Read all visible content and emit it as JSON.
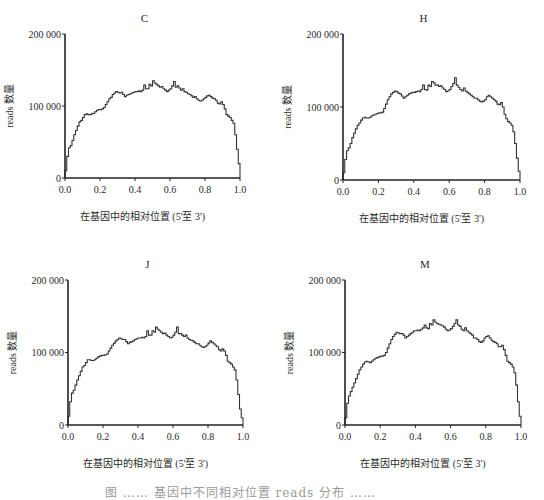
{
  "figure": {
    "caption": "图 …… 基因中不同相对位置 reads 分布 ……"
  },
  "chart_data": [
    {
      "type": "line",
      "style": "step",
      "title": "C",
      "xlabel": "在基因中的相对位置 (5'至 3')",
      "ylabel": "reads 数量",
      "xlim": [
        0,
        1
      ],
      "ylim": [
        0,
        200000
      ],
      "xticks": [
        "0.0",
        "0.2",
        "0.4",
        "0.6",
        "0.8",
        "1.0"
      ],
      "yticks": [
        "0",
        "100 000",
        "200 000"
      ],
      "grid": false,
      "legend": null,
      "x_step": 0.01,
      "values_k": [
        10,
        30,
        42,
        45,
        52,
        60,
        66,
        72,
        78,
        80,
        84,
        88,
        89,
        88,
        88,
        89,
        90,
        92,
        94,
        95,
        95,
        96,
        98,
        102,
        106,
        110,
        112,
        116,
        118,
        120,
        119,
        118,
        119,
        116,
        113,
        115,
        116,
        117,
        118,
        119,
        120,
        120,
        121,
        120,
        122,
        129,
        124,
        124,
        130,
        128,
        135,
        132,
        130,
        128,
        126,
        127,
        124,
        122,
        120,
        122,
        124,
        128,
        134,
        126,
        128,
        125,
        122,
        124,
        120,
        119,
        117,
        116,
        114,
        112,
        113,
        110,
        108,
        107,
        108,
        110,
        112,
        114,
        115,
        113,
        111,
        110,
        108,
        104,
        103,
        106,
        102,
        96,
        88,
        86,
        84,
        80,
        76,
        60,
        40,
        20
      ],
      "bbox": {
        "x0": 65,
        "y0": 34,
        "x1": 240,
        "y1": 178
      }
    },
    {
      "type": "line",
      "style": "step",
      "title": "H",
      "xlabel": "在基因中的相对位置 (5'至 3')",
      "ylabel": "reads 数量",
      "xlim": [
        0,
        1
      ],
      "ylim": [
        0,
        200000
      ],
      "xticks": [
        "0.0",
        "0.2",
        "0.4",
        "0.6",
        "0.8",
        "1.0"
      ],
      "yticks": [
        "0",
        "100 000",
        "200 000"
      ],
      "grid": false,
      "legend": null,
      "x_step": 0.01,
      "values_k": [
        10,
        28,
        40,
        44,
        50,
        58,
        64,
        70,
        75,
        78,
        82,
        85,
        86,
        85,
        85,
        86,
        88,
        89,
        90,
        91,
        92,
        92,
        93,
        98,
        104,
        110,
        114,
        118,
        120,
        122,
        121,
        119,
        118,
        115,
        112,
        114,
        116,
        118,
        119,
        120,
        120,
        121,
        122,
        121,
        124,
        130,
        124,
        123,
        130,
        128,
        135,
        133,
        130,
        130,
        128,
        129,
        126,
        124,
        121,
        122,
        124,
        128,
        132,
        140,
        130,
        127,
        124,
        122,
        126,
        122,
        120,
        118,
        116,
        114,
        112,
        112,
        110,
        108,
        107,
        108,
        110,
        114,
        116,
        114,
        112,
        110,
        108,
        104,
        103,
        106,
        100,
        90,
        84,
        80,
        78,
        75,
        66,
        50,
        30,
        12
      ],
      "bbox": {
        "x0": 343,
        "y0": 34,
        "x1": 520,
        "y1": 180
      }
    },
    {
      "type": "line",
      "style": "step",
      "title": "J",
      "xlabel": "在基因中的相对位置 (5'至 3')",
      "ylabel": "reads 数量",
      "xlim": [
        0,
        1
      ],
      "ylim": [
        0,
        200000
      ],
      "xticks": [
        "0.0",
        "0.2",
        "0.4",
        "0.6",
        "0.8",
        "1.0"
      ],
      "yticks": [
        "0",
        "100 000",
        "200 000"
      ],
      "grid": false,
      "legend": null,
      "x_step": 0.01,
      "values_k": [
        12,
        32,
        44,
        48,
        55,
        62,
        68,
        74,
        80,
        82,
        86,
        90,
        90,
        89,
        89,
        90,
        92,
        94,
        95,
        96,
        96,
        97,
        98,
        102,
        106,
        110,
        113,
        116,
        118,
        120,
        119,
        118,
        118,
        115,
        112,
        114,
        115,
        116,
        118,
        119,
        120,
        120,
        121,
        120,
        122,
        130,
        124,
        124,
        130,
        128,
        135,
        132,
        130,
        128,
        126,
        127,
        124,
        122,
        120,
        121,
        124,
        128,
        135,
        126,
        126,
        124,
        122,
        124,
        120,
        118,
        117,
        116,
        114,
        112,
        112,
        110,
        108,
        107,
        108,
        110,
        113,
        116,
        114,
        112,
        110,
        108,
        104,
        102,
        105,
        102,
        96,
        88,
        86,
        84,
        80,
        76,
        62,
        42,
        22,
        10
      ],
      "bbox": {
        "x0": 68,
        "y0": 280,
        "x1": 243,
        "y1": 425
      }
    },
    {
      "type": "line",
      "style": "step",
      "title": "M",
      "xlabel": "在基因中的相对位置 (5'至 3')",
      "ylabel": "reads 数量",
      "xlim": [
        0,
        1
      ],
      "ylim": [
        0,
        200000
      ],
      "xticks": [
        "0.0",
        "0.2",
        "0.4",
        "0.6",
        "0.8",
        "1.0"
      ],
      "yticks": [
        "0",
        "100 000",
        "200 000"
      ],
      "grid": false,
      "legend": null,
      "x_step": 0.01,
      "values_k": [
        10,
        30,
        40,
        46,
        52,
        58,
        64,
        70,
        76,
        80,
        84,
        87,
        88,
        87,
        86,
        88,
        90,
        92,
        93,
        94,
        95,
        95,
        96,
        100,
        106,
        112,
        118,
        122,
        125,
        128,
        127,
        126,
        126,
        124,
        120,
        122,
        124,
        126,
        128,
        130,
        130,
        131,
        130,
        132,
        134,
        138,
        134,
        133,
        140,
        138,
        145,
        142,
        140,
        139,
        138,
        137,
        135,
        132,
        130,
        131,
        133,
        136,
        140,
        145,
        138,
        136,
        132,
        130,
        134,
        130,
        128,
        126,
        124,
        120,
        120,
        118,
        115,
        114,
        116,
        120,
        122,
        123,
        120,
        117,
        115,
        114,
        112,
        108,
        108,
        110,
        104,
        96,
        88,
        86,
        84,
        80,
        72,
        55,
        32,
        12
      ],
      "bbox": {
        "x0": 345,
        "y0": 280,
        "x1": 521,
        "y1": 425
      }
    }
  ]
}
